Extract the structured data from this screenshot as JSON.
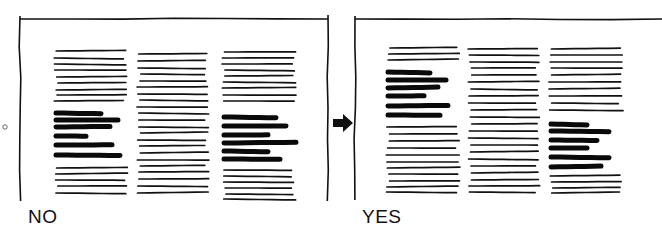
{
  "panels": [
    {
      "id": "no",
      "label": "NO",
      "label_pos": [
        28,
        204
      ],
      "frame": {
        "x1": 20,
        "x2": 328,
        "y1": 19,
        "y2": 201
      },
      "columns": [
        {
          "x": 56,
          "thin_top": [
            51,
            58,
            64,
            70,
            77,
            83,
            90,
            95,
            101
          ],
          "bold": [
            113,
            120,
            127,
            136,
            145,
            155
          ],
          "thin_bottom": [
            168,
            174,
            180,
            186,
            193
          ],
          "bold_widths": [
            45,
            62,
            54,
            30,
            56,
            64
          ],
          "width": 72
        },
        {
          "x": 139,
          "thin_all": [
            54,
            61,
            68,
            74,
            81,
            87,
            94,
            100,
            107,
            113,
            120,
            127,
            133,
            140,
            146,
            153,
            160,
            166,
            172,
            179,
            186,
            193
          ],
          "width": 70
        },
        {
          "x": 224,
          "thin_top": [
            52,
            58,
            64,
            70,
            76,
            82,
            88,
            95,
            101
          ],
          "bold_top": 117,
          "bold": [
            117,
            126,
            135,
            143,
            151,
            159
          ],
          "thin_bottom": [
            170,
            176,
            182,
            188,
            194,
            199
          ],
          "bold_widths": [
            52,
            62,
            44,
            72,
            44,
            56
          ],
          "width": 72
        }
      ]
    },
    {
      "id": "yes",
      "label": "YES",
      "label_pos": [
        362,
        204
      ],
      "frame": {
        "x1": 355,
        "x2": 662,
        "y1": 19,
        "y2": 200
      },
      "columns": [
        {
          "x": 388,
          "thin_top": [
            48,
            54,
            60
          ],
          "bold": [
            72,
            80,
            88,
            96,
            106,
            115
          ],
          "thin_bottom": [
            127,
            134,
            141,
            148,
            155,
            162,
            168,
            174,
            181,
            187,
            192
          ],
          "bold_widths": [
            42,
            58,
            50,
            36,
            60,
            52
          ],
          "width": 72
        },
        {
          "x": 470,
          "thin_all": [
            49,
            55,
            62,
            68,
            75,
            82,
            89,
            96,
            103,
            110,
            117,
            124,
            131,
            138,
            145,
            152,
            159,
            166,
            173,
            180,
            186,
            192
          ],
          "width": 70
        },
        {
          "x": 551,
          "thin_top": [
            49,
            55,
            62,
            68,
            75,
            82,
            89,
            96,
            103,
            110
          ],
          "bold": [
            124,
            131,
            140,
            148,
            157,
            167
          ],
          "thin_bottom": [
            176,
            182,
            188,
            193
          ],
          "bold_widths": [
            36,
            58,
            46,
            36,
            58,
            50
          ],
          "width": 72
        }
      ]
    }
  ],
  "arrow": {
    "x": 333,
    "y": 115,
    "direction": "right"
  },
  "side_mark": {
    "x": 3,
    "y": 127,
    "glyph": "o"
  }
}
